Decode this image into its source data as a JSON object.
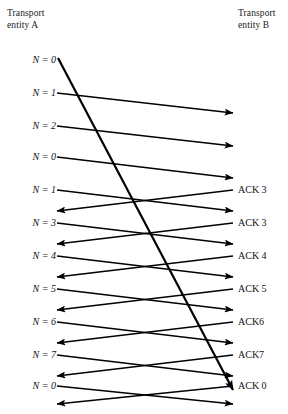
{
  "diagram": {
    "title_left": "Transport\nentity A",
    "title_right": "Transport\nentity B",
    "left_axis_x": 57,
    "right_axis_x": 233,
    "left_labels": [
      {
        "text": "N = 0",
        "y": 60
      },
      {
        "text": "N = 1",
        "y": 93
      },
      {
        "text": "N = 2",
        "y": 126
      },
      {
        "text": "N = 0",
        "y": 157
      },
      {
        "text": "N = 1",
        "y": 190
      },
      {
        "text": "N = 3",
        "y": 223
      },
      {
        "text": "N = 4",
        "y": 256
      },
      {
        "text": "N = 5",
        "y": 289
      },
      {
        "text": "N = 6",
        "y": 322
      },
      {
        "text": "N = 7",
        "y": 355
      },
      {
        "text": "N = 0",
        "y": 386
      }
    ],
    "right_labels": [
      {
        "text": "ACK 3",
        "y": 190
      },
      {
        "text": "ACK 3",
        "y": 223
      },
      {
        "text": "ACK 4",
        "y": 256
      },
      {
        "text": "ACK 5",
        "y": 289
      },
      {
        "text": "ACK6",
        "y": 322
      },
      {
        "text": "ACK7",
        "y": 355
      },
      {
        "text": "ACK 0",
        "y": 386
      }
    ],
    "data_arrows": [
      {
        "name": "data-arrow-n1",
        "x1": 57,
        "y1": 93,
        "x2": 233,
        "y2": 113
      },
      {
        "name": "data-arrow-n2",
        "x1": 57,
        "y1": 126,
        "x2": 233,
        "y2": 146
      },
      {
        "name": "data-arrow-n0-b",
        "x1": 57,
        "y1": 157,
        "x2": 233,
        "y2": 178
      },
      {
        "name": "data-arrow-n1-b",
        "x1": 57,
        "y1": 190,
        "x2": 233,
        "y2": 211
      },
      {
        "name": "data-arrow-n3",
        "x1": 57,
        "y1": 223,
        "x2": 233,
        "y2": 244
      },
      {
        "name": "data-arrow-n4",
        "x1": 57,
        "y1": 256,
        "x2": 233,
        "y2": 277
      },
      {
        "name": "data-arrow-n5",
        "x1": 57,
        "y1": 289,
        "x2": 233,
        "y2": 310
      },
      {
        "name": "data-arrow-n6",
        "x1": 57,
        "y1": 322,
        "x2": 233,
        "y2": 343
      },
      {
        "name": "data-arrow-n7",
        "x1": 57,
        "y1": 355,
        "x2": 233,
        "y2": 376
      },
      {
        "name": "data-arrow-n0-c",
        "x1": 57,
        "y1": 386,
        "x2": 233,
        "y2": 404
      }
    ],
    "ack_arrows": [
      {
        "name": "ack-arrow-3a",
        "x1": 233,
        "y1": 190,
        "x2": 57,
        "y2": 211
      },
      {
        "name": "ack-arrow-3b",
        "x1": 233,
        "y1": 223,
        "x2": 57,
        "y2": 244
      },
      {
        "name": "ack-arrow-4",
        "x1": 233,
        "y1": 256,
        "x2": 57,
        "y2": 277
      },
      {
        "name": "ack-arrow-5",
        "x1": 233,
        "y1": 289,
        "x2": 57,
        "y2": 310
      },
      {
        "name": "ack-arrow-6",
        "x1": 233,
        "y1": 322,
        "x2": 57,
        "y2": 343
      },
      {
        "name": "ack-arrow-7",
        "x1": 233,
        "y1": 355,
        "x2": 57,
        "y2": 376
      },
      {
        "name": "ack-arrow-0",
        "x1": 233,
        "y1": 386,
        "x2": 57,
        "y2": 404
      }
    ],
    "timeout_arrow": {
      "name": "timeout-retransmit-arrow",
      "x1": 58,
      "y1": 58,
      "x2": 233,
      "y2": 390
    },
    "colors": {
      "line": "#000000",
      "text": "#111111",
      "background": "#ffffff"
    }
  }
}
